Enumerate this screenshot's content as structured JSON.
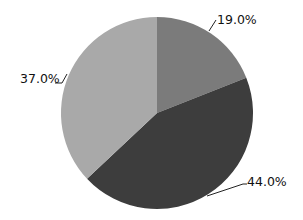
{
  "chart_data": {
    "type": "pie",
    "title": "",
    "start_angle_deg": 0,
    "direction": "clockwise",
    "center": [
      157,
      113
    ],
    "radius": 96,
    "legend": null,
    "slices": [
      {
        "label": "19.0%",
        "value": 19.0,
        "color": "#7b7b7b",
        "label_pos": [
          217,
          24
        ],
        "leader": [
          [
            209,
            31
          ],
          [
            216,
            20
          ]
        ]
      },
      {
        "label": "44.0%",
        "value": 44.0,
        "color": "#3d3d3d",
        "label_pos": [
          247,
          186
        ],
        "leader": [
          [
            207,
            196
          ],
          [
            243,
            184
          ],
          [
            247,
            184
          ]
        ]
      },
      {
        "label": "37.0%",
        "value": 37.0,
        "color": "#a9a9a9",
        "label_pos": [
          20,
          83
        ],
        "leader": [
          [
            55,
            83
          ],
          [
            62,
            83
          ],
          [
            67,
            74
          ]
        ]
      }
    ]
  }
}
